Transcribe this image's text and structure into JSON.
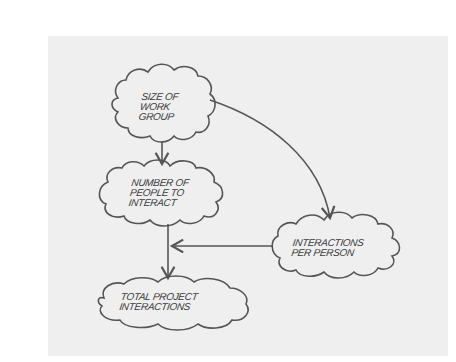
{
  "diagram": {
    "title": "",
    "colors": {
      "background": "#ffffff",
      "paper": "#efefef",
      "stroke": "#555555",
      "text": "#3a3a3a"
    },
    "nodes": [
      {
        "id": "size",
        "label": "SIZE OF\nWORK\nGROUP",
        "shape": "cloud"
      },
      {
        "id": "number",
        "label": "NUMBER OF\nPEOPLE TO\nINTERACT",
        "shape": "cloud"
      },
      {
        "id": "interactions",
        "label": "INTERACTIONS\nPER PERSON",
        "shape": "cloud"
      },
      {
        "id": "total",
        "label": "TOTAL PROJECT\nINTERACTIONS",
        "shape": "cloud"
      }
    ],
    "edges": [
      {
        "from": "size",
        "to": "number",
        "style": "straight-arrow"
      },
      {
        "from": "size",
        "to": "interactions",
        "style": "curved-arrow"
      },
      {
        "from": "interactions",
        "to": "total",
        "style": "arrow-merging-into-vertical"
      },
      {
        "from": "number",
        "to": "total",
        "style": "straight-arrow"
      }
    ]
  }
}
